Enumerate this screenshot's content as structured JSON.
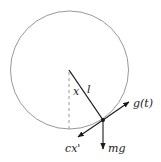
{
  "diagram": {
    "type": "pendulum-force-diagram",
    "circle": {
      "cx": 69.5,
      "cy": 70,
      "r": 59,
      "stroke": "#8c8c8c"
    },
    "pivot": {
      "x": 69,
      "y": 70
    },
    "bob": {
      "x": 103,
      "y": 120
    },
    "labels": {
      "angle": "x",
      "length": "l",
      "driving_force": "g(t)",
      "gravity": "mg",
      "damping": "cx'"
    },
    "colors": {
      "line": "#1a1a1a",
      "circle": "#8c8c8c",
      "dashed": "#8c8c8c"
    }
  }
}
